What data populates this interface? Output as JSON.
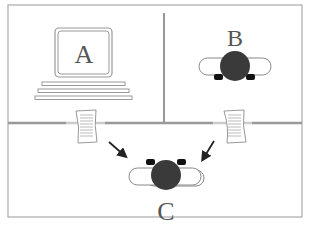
{
  "diagram": {
    "rooms": [
      {
        "label": "A",
        "content": "computer"
      },
      {
        "label": "B",
        "content": "person-at-desk"
      },
      {
        "label": "C",
        "content": "person-at-desk"
      }
    ],
    "documents": [
      {
        "from": "A",
        "to": "C"
      },
      {
        "from": "B",
        "to": "C"
      }
    ],
    "colors": {
      "wall": "#999999",
      "frame": "#aaaaaa",
      "person": "#3a3a3a",
      "label": "#555555"
    }
  }
}
